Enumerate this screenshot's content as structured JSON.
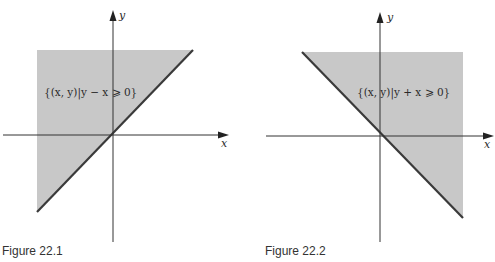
{
  "figures": [
    {
      "caption": "Figure 22.1",
      "region_label": "{(x, y)|y − x ⩾ 0}",
      "x_axis_label": "x",
      "y_axis_label": "y",
      "boundary": "y = x",
      "shaded_side": "above line y = x (upper-left)"
    },
    {
      "caption": "Figure 22.2",
      "region_label": "{(x, y)|y + x ⩾ 0}",
      "x_axis_label": "x",
      "y_axis_label": "y",
      "boundary": "y = -x",
      "shaded_side": "above line y = -x (upper-right)"
    }
  ],
  "colors": {
    "shade": "#c8c8c8",
    "line": "#3a3a3a",
    "axis": "#333333"
  }
}
